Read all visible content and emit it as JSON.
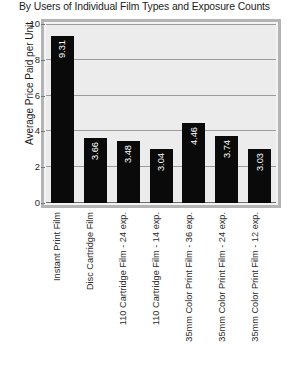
{
  "chart_data": {
    "type": "bar",
    "title": "By Users of Individual Film Types and Exposure Counts",
    "xlabel": "",
    "ylabel": "Average Price Paid per Unit",
    "ylim": [
      0,
      10
    ],
    "yticks": [
      0,
      2,
      4,
      6,
      8,
      10
    ],
    "ytick_labels": [
      "0",
      "2",
      "4",
      "6",
      "8",
      "10"
    ],
    "grid": true,
    "legend": false,
    "bar_color": "#0a0a0a",
    "plot_background": "#ececec",
    "gridline_color": "#9b9b9b",
    "value_label_color": "#ffffff",
    "value_label_rotation": -90,
    "category_label_rotation": -90,
    "categories": [
      "Instant Print Film",
      "Disc Cartridge Film",
      "110 Cartridge Film - 24 exp.",
      "110 Cartridge Film - 14 exp.",
      "35mm Color Print Film - 36 exp.",
      "35mm Color Print Film - 24 exp.",
      "35mm Color Print Film - 12 exp."
    ],
    "values": [
      9.31,
      3.66,
      3.48,
      3.04,
      4.46,
      3.74,
      3.03
    ],
    "value_labels": [
      "9.31",
      "3.66",
      "3.48",
      "3.04",
      "4.46",
      "3.74",
      "3.03"
    ]
  }
}
